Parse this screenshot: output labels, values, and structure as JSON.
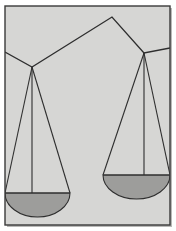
{
  "figure": {
    "canvas": {
      "width": 176,
      "height": 231
    }
  },
  "colors": {
    "page_background": "#ffffff",
    "panel_background": "#d6d6d4",
    "frame_border": "#3a3a3a",
    "line_stroke": "#2e2e2e",
    "pan_fill": "#9d9d9b",
    "pan_stroke": "#2e2e2e",
    "outer_shadow": "#b9b9b7"
  },
  "frame": {
    "name": "picture-frame",
    "x": 5,
    "y": 6,
    "width": 165,
    "height": 219,
    "stroke_width": 1.4
  },
  "beam": {
    "name": "balance-beam",
    "apex": {
      "x": 112,
      "y": 17
    },
    "left_pivot": {
      "x": 32,
      "y": 67
    },
    "right_pivot": {
      "x": 144,
      "y": 53
    },
    "left_tail": {
      "x": 5,
      "y": 52
    },
    "right_tail": {
      "x": 170,
      "y": 48
    },
    "stroke_width": 1.3
  },
  "left_assembly": {
    "name": "left-pan-assembly",
    "pivot": {
      "x": 32,
      "y": 67
    },
    "pan_top_y": 193,
    "pan_left_x": 5,
    "pan_right_x": 70,
    "pan_bottom_y": 217,
    "string_left_end": {
      "x": 5,
      "y": 193
    },
    "string_center_end": {
      "x": 32,
      "y": 193
    },
    "string_right_end": {
      "x": 70,
      "y": 193
    },
    "stroke_width": 1.1
  },
  "right_assembly": {
    "name": "right-pan-assembly",
    "pivot": {
      "x": 144,
      "y": 53
    },
    "pan_top_y": 175,
    "pan_left_x": 103,
    "pan_right_x": 170,
    "pan_bottom_y": 199,
    "string_left_end": {
      "x": 103,
      "y": 175
    },
    "string_center_end": {
      "x": 144,
      "y": 175
    },
    "string_right_end": {
      "x": 170,
      "y": 175
    },
    "stroke_width": 1.1
  },
  "labels": {
    "alt_text": "Illustration of an unbalanced two-pan weighing scale"
  }
}
